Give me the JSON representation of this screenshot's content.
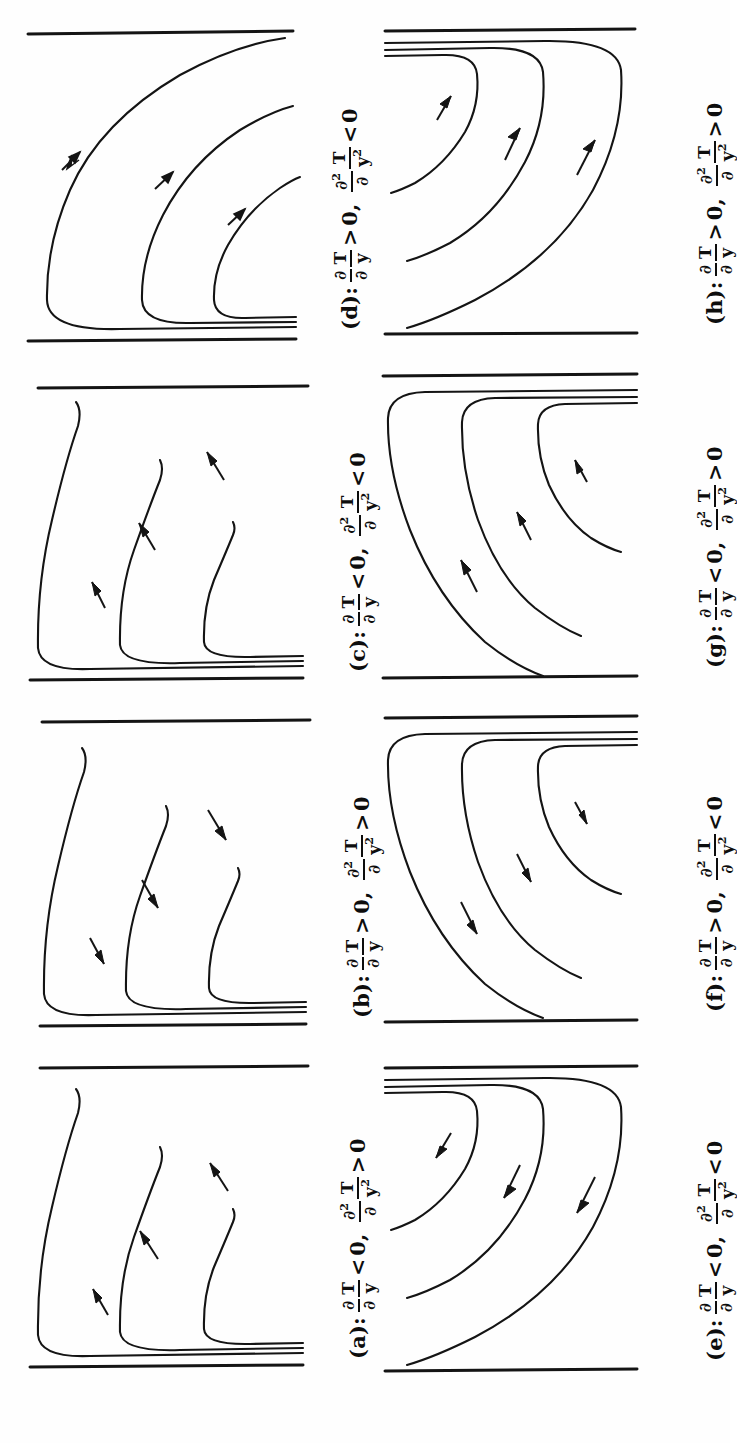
{
  "figure": {
    "kind": "streamline-sketch-grid",
    "orientation": "rotated-90",
    "rows": 4,
    "cols": 2,
    "ink_color": "#0d0d0d",
    "background": "#ffffff"
  },
  "symbols": {
    "partial": "∂",
    "T": "T",
    "y": "y",
    "two": "2",
    "zero": "0",
    "gt": ">",
    "lt": "<",
    "comma": ","
  },
  "panels": [
    {
      "id": "d",
      "tag": "(d):",
      "first_derivative": {
        "num_partial": "∂",
        "num_var": "T",
        "den_partial": "∂",
        "den_var": "y",
        "relation": ">",
        "value": "0"
      },
      "second_derivative": {
        "num_partial": "∂",
        "num_sup": "2",
        "num_var": "T",
        "den_partial": "∂",
        "den_var": "y",
        "den_sup": "2",
        "relation": "<",
        "value": "0"
      },
      "text": "(d): ∂T/∂y > 0, ∂²T/∂y² < 0",
      "wall": "bottom",
      "arrow_direction": "up-right",
      "grid": {
        "row": 0,
        "col": 0
      }
    },
    {
      "id": "h",
      "tag": "(h):",
      "first_derivative": {
        "num_partial": "∂",
        "num_var": "T",
        "den_partial": "∂",
        "den_var": "y",
        "relation": ">",
        "value": "0"
      },
      "second_derivative": {
        "num_partial": "∂",
        "num_sup": "2",
        "num_var": "T",
        "den_partial": "∂",
        "den_var": "y",
        "den_sup": "2",
        "relation": ">",
        "value": "0"
      },
      "text": "(h): ∂T/∂y > 0, ∂²T/∂y² > 0",
      "wall": "top",
      "arrow_direction": "up-right",
      "grid": {
        "row": 0,
        "col": 1
      }
    },
    {
      "id": "c",
      "tag": "(c):",
      "first_derivative": {
        "num_partial": "∂",
        "num_var": "T",
        "den_partial": "∂",
        "den_var": "y",
        "relation": "<",
        "value": "0"
      },
      "second_derivative": {
        "num_partial": "∂",
        "num_sup": "2",
        "num_var": "T",
        "den_partial": "∂",
        "den_var": "y",
        "den_sup": "2",
        "relation": "<",
        "value": "0"
      },
      "text": "(c): ∂T/∂y < 0, ∂²T/∂y² < 0",
      "wall": "bottom",
      "arrow_direction": "up-left",
      "grid": {
        "row": 1,
        "col": 0
      }
    },
    {
      "id": "g",
      "tag": "(g):",
      "first_derivative": {
        "num_partial": "∂",
        "num_var": "T",
        "den_partial": "∂",
        "den_var": "y",
        "relation": "<",
        "value": "0"
      },
      "second_derivative": {
        "num_partial": "∂",
        "num_sup": "2",
        "num_var": "T",
        "den_partial": "∂",
        "den_var": "y",
        "den_sup": "2",
        "relation": ">",
        "value": "0"
      },
      "text": "(g): ∂T/∂y < 0, ∂²T/∂y² > 0",
      "wall": "top",
      "arrow_direction": "up-left",
      "grid": {
        "row": 1,
        "col": 1
      }
    },
    {
      "id": "b",
      "tag": "(b):",
      "first_derivative": {
        "num_partial": "∂",
        "num_var": "T",
        "den_partial": "∂",
        "den_var": "y",
        "relation": ">",
        "value": "0"
      },
      "second_derivative": {
        "num_partial": "∂",
        "num_sup": "2",
        "num_var": "T",
        "den_partial": "∂",
        "den_var": "y",
        "den_sup": "2",
        "relation": ">",
        "value": "0"
      },
      "text": "(b): ∂T/∂y > 0, ∂²T/∂y² > 0",
      "wall": "bottom",
      "arrow_direction": "down-right",
      "grid": {
        "row": 2,
        "col": 0
      }
    },
    {
      "id": "f",
      "tag": "(f):",
      "first_derivative": {
        "num_partial": "∂",
        "num_var": "T",
        "den_partial": "∂",
        "den_var": "y",
        "relation": ">",
        "value": "0"
      },
      "second_derivative": {
        "num_partial": "∂",
        "num_sup": "2",
        "num_var": "T",
        "den_partial": "∂",
        "den_var": "y",
        "den_sup": "2",
        "relation": "<",
        "value": "0"
      },
      "text": "(f): ∂T/∂y > 0, ∂²T/∂y² < 0",
      "wall": "top",
      "arrow_direction": "down-right",
      "grid": {
        "row": 2,
        "col": 1
      }
    },
    {
      "id": "a",
      "tag": "(a):",
      "first_derivative": {
        "num_partial": "∂",
        "num_var": "T",
        "den_partial": "∂",
        "den_var": "y",
        "relation": "<",
        "value": "0"
      },
      "second_derivative": {
        "num_partial": "∂",
        "num_sup": "2",
        "num_var": "T",
        "den_partial": "∂",
        "den_var": "y",
        "den_sup": "2",
        "relation": ">",
        "value": "0"
      },
      "text": "(a): ∂T/∂y < 0, ∂²T/∂y² > 0",
      "wall": "bottom",
      "arrow_direction": "down-left",
      "grid": {
        "row": 3,
        "col": 0
      }
    },
    {
      "id": "e",
      "tag": "(e):",
      "first_derivative": {
        "num_partial": "∂",
        "num_var": "T",
        "den_partial": "∂",
        "den_var": "y",
        "relation": "<",
        "value": "0"
      },
      "second_derivative": {
        "num_partial": "∂",
        "num_sup": "2",
        "num_var": "T",
        "den_partial": "∂",
        "den_var": "y",
        "den_sup": "2",
        "relation": "<",
        "value": "0"
      },
      "text": "(e): ∂T/∂y < 0, ∂²T/∂y² < 0",
      "wall": "top",
      "arrow_direction": "down-left",
      "grid": {
        "row": 3,
        "col": 1
      }
    }
  ]
}
